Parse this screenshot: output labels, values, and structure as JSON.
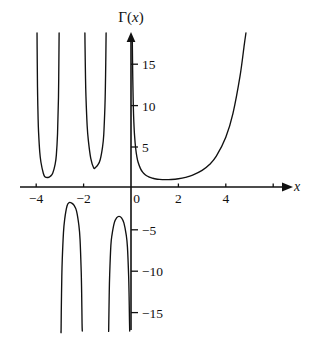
{
  "chart_data": {
    "type": "line",
    "title": "Γ(x)",
    "xlabel": "x",
    "ylabel": "Γ(x)",
    "xlim": [
      -4.6,
      5.4
    ],
    "ylim": [
      -17.5,
      18.5
    ],
    "grid": false,
    "legend": null,
    "function": "Gamma(x)",
    "x_ticks": [
      -4,
      -2,
      0,
      2,
      4
    ],
    "x_tick_labels": [
      "−4",
      "−2",
      "0",
      "2",
      "4"
    ],
    "x_minor_ticks": [
      -3,
      -1,
      1,
      3,
      5
    ],
    "y_ticks": [
      15,
      10,
      5,
      -5,
      -10,
      -15
    ],
    "y_tick_labels": [
      "15",
      "10",
      "5",
      "−5",
      "−10",
      "−15"
    ],
    "asymptotes": [
      0,
      -1,
      -2,
      -3,
      -4
    ],
    "series": [
      {
        "name": "Γ(x) branch x>0",
        "domain": [
          0.0,
          5.0
        ],
        "points": [
          [
            0.055,
            18.0
          ],
          [
            0.06,
            16.5
          ],
          [
            0.07,
            14.1
          ],
          [
            0.08,
            12.3
          ],
          [
            0.1,
            9.51
          ],
          [
            0.12,
            7.86
          ],
          [
            0.15,
            6.22
          ],
          [
            0.2,
            4.59
          ],
          [
            0.25,
            3.62
          ],
          [
            0.3,
            2.99
          ],
          [
            0.4,
            2.22
          ],
          [
            0.5,
            1.77
          ],
          [
            0.6,
            1.49
          ],
          [
            0.7,
            1.3
          ],
          [
            0.8,
            1.16
          ],
          [
            0.9,
            1.07
          ],
          [
            1.0,
            1.0
          ],
          [
            1.2,
            0.918
          ],
          [
            1.4615,
            0.8856
          ],
          [
            1.7,
            0.909
          ],
          [
            2.0,
            1.0
          ],
          [
            2.3,
            1.17
          ],
          [
            2.6,
            1.43
          ],
          [
            3.0,
            2.0
          ],
          [
            3.3,
            2.68
          ],
          [
            3.6,
            3.72
          ],
          [
            4.0,
            6.0
          ],
          [
            4.3,
            8.86
          ],
          [
            4.6,
            13.38
          ],
          [
            4.78,
            17.2
          ],
          [
            4.85,
            19.0
          ]
        ]
      },
      {
        "name": "Γ(x) branch -1<x<0",
        "domain": [
          -1.0,
          0.0
        ],
        "minimum_label": "local max ≈ -3.545 at x ≈ -0.5046",
        "points": [
          [
            -0.945,
            -18.2
          ],
          [
            -0.94,
            -17.0
          ],
          [
            -0.92,
            -13.1
          ],
          [
            -0.9,
            -10.6
          ],
          [
            -0.85,
            -7.06
          ],
          [
            -0.8,
            -5.74
          ],
          [
            -0.7,
            -4.27
          ],
          [
            -0.6,
            -3.7
          ],
          [
            -0.5046,
            -3.545
          ],
          [
            -0.4,
            -3.72
          ],
          [
            -0.3,
            -4.33
          ],
          [
            -0.2,
            -5.82
          ],
          [
            -0.15,
            -7.26
          ],
          [
            -0.1,
            -10.69
          ],
          [
            -0.08,
            -13.2
          ],
          [
            -0.065,
            -16.0
          ],
          [
            -0.055,
            -18.5
          ]
        ]
      },
      {
        "name": "Γ(x) branch -2<x<-1",
        "domain": [
          -2.0,
          -1.0
        ],
        "minimum_label": "local min ≈ 2.302 at x ≈ -1.5734",
        "points": [
          [
            -1.945,
            19.0
          ],
          [
            -1.94,
            17.2
          ],
          [
            -1.92,
            13.3
          ],
          [
            -1.9,
            10.9
          ],
          [
            -1.85,
            7.4
          ],
          [
            -1.8,
            5.63
          ],
          [
            -1.7,
            3.5
          ],
          [
            -1.5734,
            2.302
          ],
          [
            -1.5,
            2.363
          ],
          [
            -1.4,
            2.66
          ],
          [
            -1.3,
            3.29
          ],
          [
            -1.2,
            4.85
          ],
          [
            -1.15,
            6.31
          ],
          [
            -1.1,
            9.71
          ],
          [
            -1.08,
            12.2
          ],
          [
            -1.065,
            15.0
          ],
          [
            -1.055,
            17.5
          ],
          [
            -1.05,
            19.0
          ]
        ]
      },
      {
        "name": "Γ(x) branch -3<x<-2",
        "domain": [
          -3.0,
          -2.0
        ],
        "minimum_label": "local max ≈ -0.888 at x ≈ -2.6107",
        "points": [
          [
            -2.955,
            -19.0
          ],
          [
            -2.95,
            -17.6
          ],
          [
            -2.94,
            -14.6
          ],
          [
            -2.92,
            -10.9
          ],
          [
            -2.9,
            -8.73
          ],
          [
            -2.85,
            -5.54
          ],
          [
            -2.8,
            -3.93
          ],
          [
            -2.7,
            -2.3
          ],
          [
            -2.6107,
            -1.888
          ],
          [
            -2.5,
            -1.945
          ],
          [
            -2.4,
            -2.23
          ],
          [
            -2.3,
            -2.88
          ],
          [
            -2.2,
            -4.62
          ],
          [
            -2.15,
            -6.33
          ],
          [
            -2.1,
            -10.3
          ],
          [
            -2.08,
            -13.2
          ],
          [
            -2.065,
            -16.5
          ],
          [
            -2.055,
            -19.0
          ]
        ]
      },
      {
        "name": "Γ(x) branch -4<x<-3",
        "domain": [
          -4.0,
          -3.0
        ],
        "minimum_label": "local min ≈ 0.245 at x ≈ -3.6353",
        "points": [
          [
            -3.965,
            19.0
          ],
          [
            -3.96,
            16.6
          ],
          [
            -3.95,
            13.3
          ],
          [
            -3.94,
            11.1
          ],
          [
            -3.92,
            8.3
          ],
          [
            -3.9,
            6.63
          ],
          [
            -3.85,
            4.22
          ],
          [
            -3.8,
            2.99
          ],
          [
            -3.7,
            1.66
          ],
          [
            -3.6353,
            1.245
          ],
          [
            -3.5,
            1.145
          ],
          [
            -3.4,
            1.3
          ],
          [
            -3.3,
            1.69
          ],
          [
            -3.2,
            2.77
          ],
          [
            -3.15,
            3.85
          ],
          [
            -3.1,
            6.39
          ],
          [
            -3.06,
            10.8
          ],
          [
            -3.04,
            16.2
          ],
          [
            -3.033,
            19.0
          ]
        ]
      }
    ]
  },
  "labels": {
    "title": "Γ(x)",
    "title_gamma": "Γ(",
    "title_var": "x",
    "title_close": ")",
    "x_axis_name": "x",
    "x_tick_neg4": "−4",
    "x_tick_neg2": "−2",
    "x_tick_0": "0",
    "x_tick_2": "2",
    "x_tick_4": "4",
    "y_tick_15": "15",
    "y_tick_10": "10",
    "y_tick_5": "5",
    "y_tick_neg5": "−5",
    "y_tick_neg10": "−10",
    "y_tick_neg15": "−15"
  },
  "style": {
    "stroke_color": "#111111",
    "background": "#ffffff"
  }
}
